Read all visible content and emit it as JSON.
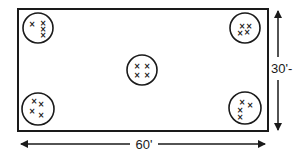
{
  "diagram": {
    "type": "site-plan",
    "colors": {
      "stroke": "#1a1a1a",
      "background": "#ffffff"
    },
    "boundary": {
      "x": 18,
      "y": 9,
      "width": 250,
      "height": 122
    },
    "dimensions": {
      "width_label": "60'",
      "height_label": "30'-"
    },
    "marker_glyph": "×",
    "clusters": [
      {
        "id": "top-left",
        "cx": 38,
        "cy": 28,
        "r": 15,
        "marks": [
          [
            32,
            24
          ],
          [
            43,
            23
          ],
          [
            43,
            29
          ],
          [
            43,
            35
          ]
        ]
      },
      {
        "id": "top-right",
        "cx": 245,
        "cy": 28,
        "r": 15,
        "marks": [
          [
            242,
            26
          ],
          [
            249,
            26
          ],
          [
            240,
            33
          ],
          [
            247,
            32
          ]
        ]
      },
      {
        "id": "center",
        "cx": 142,
        "cy": 70,
        "r": 15,
        "marks": [
          [
            137,
            66
          ],
          [
            147,
            66
          ],
          [
            137,
            75
          ],
          [
            147,
            75
          ]
        ]
      },
      {
        "id": "bottom-left",
        "cx": 38,
        "cy": 109,
        "r": 16,
        "marks": [
          [
            34,
            101
          ],
          [
            41,
            104
          ],
          [
            32,
            111
          ],
          [
            41,
            115
          ]
        ]
      },
      {
        "id": "bottom-right",
        "cx": 245,
        "cy": 108,
        "r": 16,
        "marks": [
          [
            242,
            102
          ],
          [
            250,
            105
          ],
          [
            240,
            110
          ],
          [
            240,
            117
          ]
        ]
      }
    ]
  }
}
